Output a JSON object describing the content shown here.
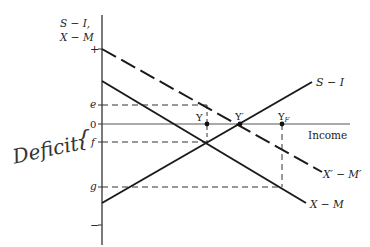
{
  "diagram": {
    "y_axis_label_line1": "S − I,",
    "y_axis_label_line2": "X − M",
    "x_axis_label": "Income",
    "y_ticks": {
      "plus": "+",
      "e": "e",
      "zero": "0",
      "f": "f",
      "g": "g",
      "minus": "−"
    },
    "curves": {
      "s_minus_i": "S − I",
      "x_minus_m": "X − M",
      "x_prime_minus_m_prime": "X′ − M′"
    },
    "points": {
      "y": "Y",
      "y_prime": "Y′",
      "y_f_base": "Y",
      "y_f_sub": "F"
    },
    "annotation": {
      "handwritten": "Deficit",
      "brace": "{"
    },
    "colors": {
      "line": "#1a1a1a",
      "axis": "#333333",
      "background": "#ffffff"
    }
  }
}
